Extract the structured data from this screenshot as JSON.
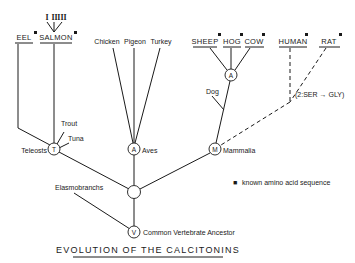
{
  "title": "EVOLUTION OF THE CALCITONINS",
  "legend": {
    "marker": "■",
    "text": "known amino acid sequence"
  },
  "species": {
    "eel": "EEL",
    "salmon": "SALMON",
    "salmon_variants": [
      "I",
      "II",
      "III"
    ],
    "chicken": "Chicken",
    "pigeon": "Pigeon",
    "turkey": "Turkey",
    "sheep": "SHEEP",
    "hog": "HOG",
    "cow": "COW",
    "human": "HUMAN",
    "rat": "RAT",
    "trout": "Trout",
    "tuna": "Tuna",
    "dog": "Dog"
  },
  "nodes": {
    "teleosts": {
      "letter": "T",
      "label": "Teleosts"
    },
    "aves": {
      "letter": "A",
      "label": "Aves"
    },
    "mammalia": {
      "letter": "M",
      "label": "Mammalia"
    },
    "artiodactyla": {
      "letter": "A"
    },
    "elasmobranchs": {
      "label": "Elasmobranchs"
    },
    "vertebrate": {
      "letter": "V",
      "label": "Common Vertebrate Ancestor"
    }
  },
  "annotation": "(2:SER → GLY)",
  "known_sequence": [
    "EEL",
    "SALMON",
    "SHEEP",
    "HOG",
    "COW",
    "HUMAN",
    "RAT"
  ]
}
